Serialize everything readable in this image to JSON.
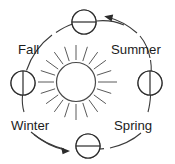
{
  "diagram": {
    "center_object": {
      "name": "sun",
      "label": "",
      "ray_count": 20
    },
    "orbit": {
      "direction": "counterclockwise",
      "center_x": 87,
      "center_y": 82,
      "radius_x": 63,
      "radius_y": 62,
      "stroke_color": "#3a3a3a"
    },
    "labels": [
      {
        "id": "fall",
        "text": "Fall",
        "x": 18,
        "y": 54
      },
      {
        "id": "summer",
        "text": "Summer",
        "x": 111,
        "y": 54
      },
      {
        "id": "winter",
        "text": "Winter",
        "x": 11,
        "y": 130
      },
      {
        "id": "spring",
        "text": "Spring",
        "x": 114,
        "y": 130
      }
    ],
    "earth_positions": [
      {
        "id": "earth-top",
        "season_between": "Summer-Fall",
        "cx": 84,
        "cy": 22,
        "r": 12,
        "terminator": "horizontal",
        "shaded_half": "top",
        "shade_color": "#d9d9d9"
      },
      {
        "id": "earth-left",
        "season": "Fall-Winter",
        "cx": 23,
        "cy": 83,
        "r": 12,
        "terminator": "vertical",
        "shaded_half": "right",
        "shade_color": "#eaeaea"
      },
      {
        "id": "earth-bottom",
        "season_between": "Winter-Spring",
        "cx": 88,
        "cy": 146,
        "r": 12,
        "terminator": "horizontal",
        "shaded_half": "bottom",
        "shade_color": "#d9d9d9"
      },
      {
        "id": "earth-right",
        "season": "Summer-Spring",
        "cx": 150,
        "cy": 83,
        "r": 12,
        "terminator": "vertical",
        "shaded_half": "right",
        "shade_color": "#e3e3e3"
      }
    ],
    "arrows": [
      {
        "id": "arrow-top-right",
        "points_toward": "top",
        "tip_x": 104,
        "tip_y": 17,
        "description": "arrow from Summer side curving up-left toward top Earth"
      },
      {
        "id": "arrow-bottom-left",
        "points_toward": "bottom",
        "tip_x": 69,
        "tip_y": 151,
        "description": "arrow from Winter side curving right toward bottom Earth"
      }
    ],
    "colors": {
      "stroke": "#2b2b2b",
      "orbit": "#3a3a3a",
      "shade": "#d9d9d9",
      "background": "#ffffff",
      "text": "#1c1c1c"
    }
  }
}
